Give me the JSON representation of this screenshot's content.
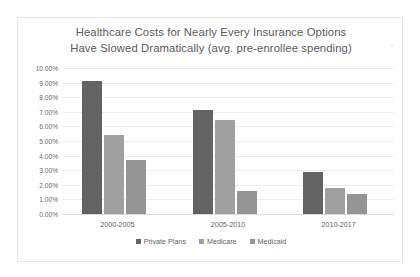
{
  "chart_data": {
    "type": "bar",
    "title": "Healthcare Costs for Nearly Every Insurance Options Have Slowed Dramatically (avg. pre-enrollee spending)",
    "title_lines": [
      "Healthcare Costs for Nearly Every Insurance Options",
      "Have Slowed Dramatically (avg. pre-enrollee spending)"
    ],
    "categories": [
      "2000-2005",
      "2005-2010",
      "2010-2017"
    ],
    "series": [
      {
        "name": "Private Plans",
        "color": "#636363",
        "values": [
          9.1,
          7.15,
          2.9
        ]
      },
      {
        "name": "Medicare",
        "color": "#a0a0a0",
        "values": [
          5.4,
          6.45,
          1.8
        ]
      },
      {
        "name": "Medicaid",
        "color": "#949494",
        "values": [
          3.7,
          1.6,
          1.35
        ]
      }
    ],
    "xlabel": "",
    "ylabel": "",
    "ylim": [
      0,
      10
    ],
    "ytick_labels": [
      "10.00%",
      "9.00%",
      "8.00%",
      "7.00%",
      "6.00%",
      "5.00%",
      "4.00%",
      "3.00%",
      "2.00%",
      "1.00%",
      "0.00%"
    ],
    "ytick_values": [
      10,
      9,
      8,
      7,
      6,
      5,
      4,
      3,
      2,
      1,
      0
    ],
    "grid": true,
    "legend_position": "bottom"
  }
}
